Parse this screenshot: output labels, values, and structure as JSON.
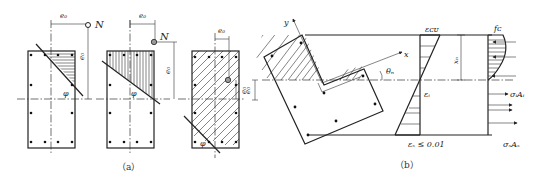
{
  "figure": {
    "panel_a": {
      "caption": "（a）",
      "sections": [
        {
          "ecc_x_label": "e₀",
          "ecc_y_label": "e₀",
          "load_label": "N",
          "angle_label": "φ"
        },
        {
          "ecc_x_label": "e₀",
          "ecc_y_label": "e₀",
          "load_label": "N",
          "angle_label": "φ"
        },
        {
          "ecc_x_label": "e₀",
          "ecc_y_label": "e₀",
          "angle_label": "φ"
        }
      ]
    },
    "panel_b": {
      "caption": "（b）",
      "axis_x_label": "x",
      "axis_y_label": "y",
      "angle_label": "θₙ",
      "strain_top_label": "εᴄᴜ",
      "strain_mid_label": "εᵢ",
      "strain_bottom_label": "εₛ ≤ 0.01",
      "depth_label": "xₙ",
      "stress_label": "fᴄ",
      "force_label_1": "σᵢAᵢ",
      "force_label_2": "σₛAₛ",
      "ecc_label": "e₀"
    }
  }
}
